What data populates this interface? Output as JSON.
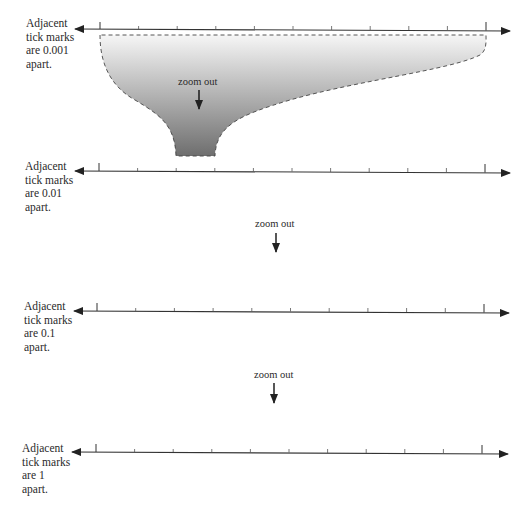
{
  "rows": [
    {
      "caption_lines": [
        "Adjacent",
        "tick marks",
        "are 0.001",
        "apart."
      ],
      "spacing": "0.001"
    },
    {
      "caption_lines": [
        "Adjacent",
        "tick marks",
        "are 0.01",
        "apart."
      ],
      "spacing": "0.01"
    },
    {
      "caption_lines": [
        "Adjacent",
        "tick marks",
        "are 0.1",
        "apart."
      ],
      "spacing": "0.1"
    },
    {
      "caption_lines": [
        "Adjacent",
        "tick marks",
        "are 1",
        "apart."
      ],
      "spacing": "1"
    }
  ],
  "zoom_labels": [
    "zoom out",
    "zoom out",
    "zoom out"
  ],
  "colors": {
    "line": "#333333",
    "funnel_top": "#f4f4f4",
    "funnel_bottom": "#6f6f6f"
  }
}
